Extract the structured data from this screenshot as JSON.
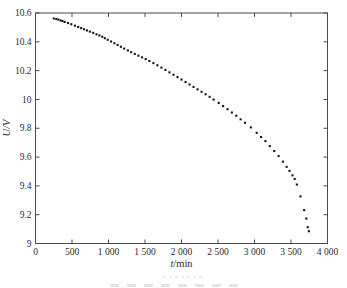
{
  "colors": {
    "background": "#ffffff",
    "frame": "#4a4a4a",
    "tick_text": "#2b2b2b",
    "point": "#161616",
    "caption_remnant": "#cfcfcf"
  },
  "chart_data": {
    "type": "scatter",
    "title": "",
    "xlabel": "t/min",
    "xlabel_var": "t",
    "xlabel_unit": "/min",
    "ylabel": "U/V",
    "xlim": [
      0,
      4000
    ],
    "ylim": [
      9,
      10.6
    ],
    "grid": false,
    "legend": "none",
    "marker": "small-black-square",
    "x_ticks": [
      0,
      500,
      1000,
      1500,
      2000,
      2500,
      3000,
      3500,
      4000
    ],
    "x_tick_labels": [
      "0",
      "500",
      "1 000",
      "1 500",
      "2 000",
      "2 500",
      "3 000",
      "3 500",
      "4 000"
    ],
    "y_ticks": [
      9,
      9.2,
      9.4,
      9.6,
      9.8,
      10,
      10.2,
      10.4,
      10.6
    ],
    "y_tick_labels": [
      "9",
      "9.2",
      "9.4",
      "9.6",
      "9.8",
      "10",
      "10.2",
      "10.4",
      "10.6"
    ],
    "points": [
      [
        250,
        10.562
      ],
      [
        285,
        10.558
      ],
      [
        315,
        10.554
      ],
      [
        345,
        10.548
      ],
      [
        370,
        10.544
      ],
      [
        400,
        10.538
      ],
      [
        445,
        10.53
      ],
      [
        490,
        10.522
      ],
      [
        540,
        10.512
      ],
      [
        585,
        10.503
      ],
      [
        625,
        10.495
      ],
      [
        665,
        10.487
      ],
      [
        705,
        10.479
      ],
      [
        745,
        10.471
      ],
      [
        790,
        10.462
      ],
      [
        835,
        10.452
      ],
      [
        875,
        10.444
      ],
      [
        915,
        10.435
      ],
      [
        950,
        10.425
      ],
      [
        990,
        10.414
      ],
      [
        1035,
        10.402
      ],
      [
        1080,
        10.39
      ],
      [
        1125,
        10.378
      ],
      [
        1170,
        10.366
      ],
      [
        1215,
        10.353
      ],
      [
        1265,
        10.34
      ],
      [
        1310,
        10.328
      ],
      [
        1360,
        10.316
      ],
      [
        1410,
        10.304
      ],
      [
        1460,
        10.292
      ],
      [
        1510,
        10.28
      ],
      [
        1560,
        10.267
      ],
      [
        1615,
        10.252
      ],
      [
        1670,
        10.237
      ],
      [
        1725,
        10.221
      ],
      [
        1780,
        10.205
      ],
      [
        1835,
        10.188
      ],
      [
        1890,
        10.171
      ],
      [
        1945,
        10.155
      ],
      [
        2000,
        10.138
      ],
      [
        2055,
        10.121
      ],
      [
        2110,
        10.104
      ],
      [
        2165,
        10.087
      ],
      [
        2220,
        10.07
      ],
      [
        2275,
        10.053
      ],
      [
        2330,
        10.036
      ],
      [
        2385,
        10.018
      ],
      [
        2440,
        9.999
      ],
      [
        2510,
        9.976
      ],
      [
        2570,
        9.954
      ],
      [
        2630,
        9.932
      ],
      [
        2690,
        9.909
      ],
      [
        2750,
        9.887
      ],
      [
        2810,
        9.862
      ],
      [
        2870,
        9.838
      ],
      [
        2950,
        9.806
      ],
      [
        3030,
        9.768
      ],
      [
        3090,
        9.739
      ],
      [
        3150,
        9.711
      ],
      [
        3210,
        9.676
      ],
      [
        3270,
        9.642
      ],
      [
        3330,
        9.607
      ],
      [
        3390,
        9.568
      ],
      [
        3440,
        9.532
      ],
      [
        3480,
        9.504
      ],
      [
        3520,
        9.473
      ],
      [
        3550,
        9.448
      ],
      [
        3580,
        9.409
      ],
      [
        3630,
        9.327
      ],
      [
        3680,
        9.232
      ],
      [
        3710,
        9.173
      ],
      [
        3730,
        9.113
      ],
      [
        3745,
        9.085
      ]
    ]
  }
}
